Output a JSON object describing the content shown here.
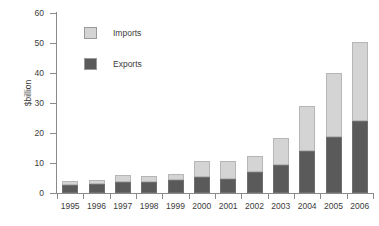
{
  "chart_data": {
    "type": "bar",
    "stacked": true,
    "title": "",
    "xlabel": "",
    "ylabel": "$billion",
    "ylim": [
      0,
      60
    ],
    "yticks": [
      0,
      10,
      20,
      30,
      40,
      50,
      60
    ],
    "grid": false,
    "legend_position": "inside-top-left",
    "categories": [
      "1995",
      "1996",
      "1997",
      "1998",
      "1999",
      "2000",
      "2001",
      "2002",
      "2003",
      "2004",
      "2005",
      "2006"
    ],
    "series": [
      {
        "name": "Exports",
        "color": "#5a5a5a",
        "values": [
          2.8,
          3.0,
          3.6,
          3.8,
          4.2,
          5.3,
          4.8,
          6.9,
          9.3,
          14.0,
          18.6,
          24.0
        ]
      },
      {
        "name": "Imports",
        "color": "#d4d4d4",
        "values": [
          1.3,
          1.2,
          2.3,
          2.0,
          2.3,
          5.4,
          5.8,
          5.4,
          9.0,
          15.0,
          21.4,
          26.5
        ]
      }
    ],
    "totals": [
      4.1,
      4.2,
      5.9,
      5.8,
      6.5,
      10.7,
      10.6,
      12.3,
      18.3,
      29.0,
      40.0,
      50.5
    ],
    "axis_color": "#8a8a8a",
    "text_color": "#3c3c3c",
    "background": "#ffffff"
  },
  "legend": {
    "items": [
      {
        "label": "Imports",
        "color": "#d4d4d4"
      },
      {
        "label": "Exports",
        "color": "#5a5a5a"
      }
    ]
  }
}
